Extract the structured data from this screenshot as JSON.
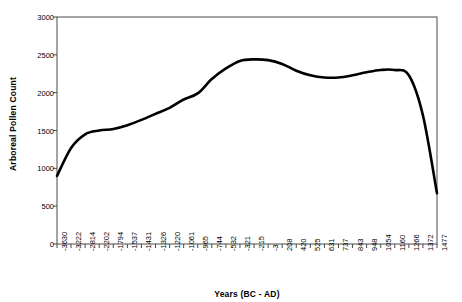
{
  "chart_data": {
    "type": "line",
    "title": "",
    "xlabel": "Years (BC - AD)",
    "ylabel": "Arboreal Pollen Count",
    "ylim": [
      0,
      3000
    ],
    "ytick_labels": [
      "0",
      "500",
      "1000",
      "1500",
      "2000",
      "2500",
      "3000"
    ],
    "ytick_values": [
      0,
      500,
      1000,
      1500,
      2000,
      2500,
      3000
    ],
    "grid": false,
    "legend": "none",
    "categories": [
      "-3630",
      "-3222",
      "-2814",
      "-2202",
      "-1794",
      "-1537",
      "-1431",
      "-1326",
      "-1220",
      "-1061",
      "-965",
      "-744",
      "-532",
      "-321",
      "-215",
      "-3",
      "208",
      "420",
      "525",
      "631",
      "737",
      "843",
      "948",
      "1054",
      "1160",
      "1266",
      "1372",
      "1477"
    ],
    "values": [
      900,
      1270,
      1450,
      1500,
      1520,
      1570,
      1640,
      1720,
      1800,
      1910,
      1990,
      2180,
      2320,
      2420,
      2440,
      2430,
      2380,
      2290,
      2230,
      2200,
      2200,
      2230,
      2270,
      2300,
      2300,
      2230,
      1700,
      670
    ],
    "series_name": "Arboreal Pollen Count",
    "line_color": "#000000",
    "line_width": 2.6
  }
}
